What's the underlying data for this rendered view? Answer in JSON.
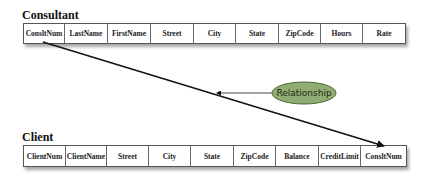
{
  "consultant": {
    "title": "Consultant",
    "columns": [
      "ConsltNum",
      "LastName",
      "FirstName",
      "Street",
      "City",
      "State",
      "ZipCode",
      "Hours",
      "Rate"
    ]
  },
  "client": {
    "title": "Client",
    "columns": [
      "ClientNum",
      "ClientName",
      "Street",
      "City",
      "State",
      "ZipCode",
      "Balance",
      "CreditLimit",
      "ConsltNum"
    ]
  },
  "relationship": {
    "label": "Relationship",
    "fill_color": "#8fac74",
    "border_color": "#4d6a35"
  }
}
